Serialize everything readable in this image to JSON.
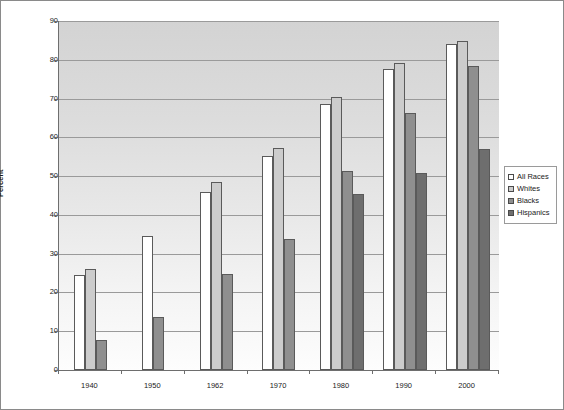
{
  "chart_data": {
    "type": "bar",
    "title": "",
    "xlabel": "",
    "ylabel": "Percent",
    "ylim": [
      0,
      90
    ],
    "ytick_step": 10,
    "yticks": [
      "0",
      "10",
      "20",
      "30",
      "40",
      "50",
      "60",
      "70",
      "80",
      "90"
    ],
    "grid": true,
    "legend_position": "right",
    "categories": [
      "1940",
      "1950",
      "1962",
      "1970",
      "1980",
      "1990",
      "2000"
    ],
    "series": [
      {
        "name": "All Races",
        "color": "#ffffff",
        "values": [
          24.5,
          34.5,
          46.0,
          55.2,
          68.6,
          77.6,
          84.1
        ]
      },
      {
        "name": "Whites",
        "color": "#cccccc",
        "values": [
          26.1,
          null,
          48.6,
          57.2,
          70.5,
          79.1,
          84.9
        ]
      },
      {
        "name": "Blacks",
        "color": "#8f8f8f",
        "values": [
          7.7,
          13.7,
          24.8,
          33.9,
          51.2,
          66.2,
          78.5
        ]
      },
      {
        "name": "Hispanics",
        "color": "#6e6e6e",
        "values": [
          null,
          null,
          null,
          null,
          45.3,
          50.8,
          57.0
        ]
      }
    ]
  },
  "legend": {
    "items": [
      {
        "label": "All Races"
      },
      {
        "label": "Whites"
      },
      {
        "label": "Blacks"
      },
      {
        "label": "Hispanics"
      }
    ]
  }
}
